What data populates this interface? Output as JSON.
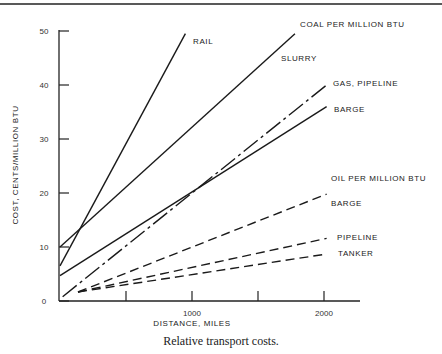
{
  "chart_data": {
    "type": "line",
    "title": "",
    "caption": "Relative transport costs.",
    "xlabel": "DISTANCE, MILES",
    "ylabel": "COST, CENTS/MILLION BTU",
    "xlim": [
      0,
      2300
    ],
    "ylim": [
      0,
      50
    ],
    "x_ticks": [
      500,
      1000,
      1500,
      2000
    ],
    "x_tick_labels": [
      "",
      "1000",
      "",
      "2000"
    ],
    "y_ticks": [
      0,
      10,
      20,
      30,
      40,
      50
    ],
    "y_tick_labels": [
      "0",
      "10",
      "20",
      "30",
      "40",
      "50"
    ],
    "grid": false,
    "legend_position": "inline labels at line ends",
    "groups": [
      {
        "name": "COAL PER MILLION BTU",
        "series": [
          "RAIL",
          "SLURRY",
          "BARGE (coal)"
        ]
      },
      {
        "name": "GAS",
        "series": [
          "GAS, PIPELINE"
        ]
      },
      {
        "name": "OIL PER MILLION BTU",
        "series": [
          "BARGE (oil)",
          "PIPELINE",
          "TANKER"
        ]
      }
    ],
    "series": [
      {
        "name": "RAIL",
        "group": "coal",
        "style": "solid",
        "x": [
          0,
          950
        ],
        "y": [
          6.5,
          49.5
        ]
      },
      {
        "name": "SLURRY",
        "group": "coal",
        "style": "solid",
        "x": [
          0,
          1780
        ],
        "y": [
          10,
          49.5
        ]
      },
      {
        "name": "BARGE",
        "group": "coal",
        "style": "solid",
        "x": [
          0,
          2020
        ],
        "y": [
          4.7,
          36
        ]
      },
      {
        "name": "GAS, PIPELINE",
        "group": "gas",
        "style": "dash-dot",
        "x": [
          20,
          2020
        ],
        "y": [
          0.8,
          40
        ]
      },
      {
        "name": "BARGE",
        "group": "oil",
        "style": "dashed",
        "x": [
          20,
          2020
        ],
        "y": [
          0.8,
          19.8
        ]
      },
      {
        "name": "PIPELINE",
        "group": "oil",
        "style": "dashed",
        "x": [
          20,
          2020
        ],
        "y": [
          0.8,
          11.6
        ]
      },
      {
        "name": "TANKER",
        "group": "oil",
        "style": "dashed",
        "x": [
          20,
          2020
        ],
        "y": [
          0.8,
          8.7
        ]
      }
    ]
  },
  "labels": {
    "coal_header": "COAL PER MILLION BTU",
    "rail": "RAIL",
    "slurry": "SLURRY",
    "gas_pipeline": "GAS, PIPELINE",
    "coal_barge": "BARGE",
    "oil_header": "OIL PER MILLION BTU",
    "oil_barge": "BARGE",
    "oil_pipeline": "PIPELINE",
    "tanker": "TANKER"
  }
}
